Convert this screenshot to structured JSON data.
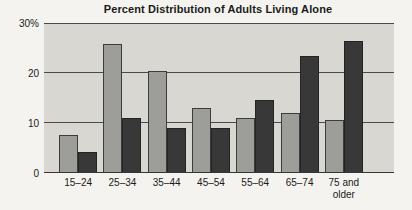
{
  "chart_data": {
    "type": "bar",
    "title": "Percent Distribution of Adults Living Alone",
    "categories": [
      "15–24",
      "25–34",
      "35–44",
      "45–54",
      "55–64",
      "65–74",
      "75 and older"
    ],
    "series": [
      {
        "name": "lighter-gray-bars",
        "color": "#9d9d9a",
        "values": [
          7.5,
          26,
          20.5,
          13,
          11,
          12,
          10.5
        ]
      },
      {
        "name": "darker-gray-bars",
        "color": "#383838",
        "values": [
          4,
          11,
          9,
          9,
          14.5,
          23.5,
          26.5
        ]
      }
    ],
    "xlabel": "",
    "ylabel": "",
    "ylim": [
      0,
      30
    ],
    "yticks": [
      {
        "value": 0,
        "label": "0"
      },
      {
        "value": 10,
        "label": "10"
      },
      {
        "value": 20,
        "label": "20"
      },
      {
        "value": 30,
        "label": "30%"
      }
    ],
    "grid": true,
    "legend_position": "none",
    "plot_background": "#d8d7d2",
    "page_background": "#f4f3ef",
    "gridline_color": "#4a4a4a"
  }
}
